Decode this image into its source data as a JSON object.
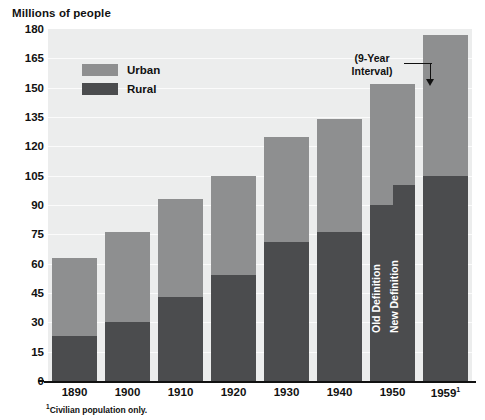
{
  "chart_data": {
    "type": "bar",
    "title": "Millions of people",
    "subtitle": "",
    "xlabel": "",
    "ylabel": "Millions of people",
    "ylim": [
      0,
      180
    ],
    "yticks": [
      0,
      15,
      30,
      45,
      60,
      75,
      90,
      105,
      120,
      135,
      150,
      165,
      180
    ],
    "grid": true,
    "stacked": true,
    "legend_position": "inside-top-left",
    "categories": [
      "1890",
      "1900",
      "1910",
      "1920",
      "1930",
      "1940",
      "1950",
      "1959"
    ],
    "series": [
      {
        "name": "Rural",
        "color": "#4b4c4e",
        "values": [
          23,
          30,
          43,
          54,
          71,
          76,
          90,
          105
        ]
      },
      {
        "name": "Urban",
        "color": "#8e8f90",
        "values": [
          40,
          46,
          50,
          51,
          54,
          58,
          62,
          72
        ]
      }
    ],
    "totals": [
      63,
      76,
      93,
      105,
      125,
      134,
      152,
      177
    ],
    "annotations": [
      {
        "text": "(9-Year Interval)",
        "target": "1959"
      },
      {
        "text": "Old Definition",
        "target": "1950",
        "value": 90
      },
      {
        "text": "New Definition",
        "target": "1950",
        "value": 100
      }
    ],
    "footnote": "Civilian population only."
  },
  "header": {
    "axis_title": "Millions of people"
  },
  "yaxis": {
    "ticks": [
      {
        "label": "180",
        "value": 180
      },
      {
        "label": "165",
        "value": 165
      },
      {
        "label": "150",
        "value": 150
      },
      {
        "label": "135",
        "value": 135
      },
      {
        "label": "120",
        "value": 120
      },
      {
        "label": "105",
        "value": 105
      },
      {
        "label": "90",
        "value": 90
      },
      {
        "label": "75",
        "value": 75
      },
      {
        "label": "60",
        "value": 60
      },
      {
        "label": "45",
        "value": 45
      },
      {
        "label": "30",
        "value": 30
      },
      {
        "label": "15",
        "value": 15
      },
      {
        "label": "0",
        "value": 0
      }
    ]
  },
  "xaxis": {
    "ticks": [
      {
        "label": "1890",
        "sup": ""
      },
      {
        "label": "1900",
        "sup": ""
      },
      {
        "label": "1910",
        "sup": ""
      },
      {
        "label": "1920",
        "sup": ""
      },
      {
        "label": "1930",
        "sup": ""
      },
      {
        "label": "1940",
        "sup": ""
      },
      {
        "label": "1950",
        "sup": ""
      },
      {
        "label": "1959",
        "sup": "1"
      }
    ]
  },
  "legend": {
    "items": [
      {
        "label": "Urban",
        "color": "#8e8f90"
      },
      {
        "label": "Rural",
        "color": "#4b4c4e"
      }
    ]
  },
  "annotation": {
    "line1": "(9-Year",
    "line2": "Interval)"
  },
  "bar_labels": {
    "old_definition": "Old Definition",
    "new_definition": "New Definition"
  },
  "footnote": {
    "marker": "1",
    "text": "Civilian population only."
  },
  "colors": {
    "urban": "#8e8f90",
    "rural": "#4b4c4e",
    "plot_background": "#eceded",
    "gridline": "#fbfbfb",
    "axis": "#111111",
    "page_background": "#ffffff"
  }
}
